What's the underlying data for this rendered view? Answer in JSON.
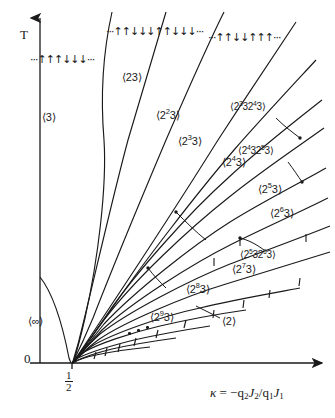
{
  "figure": {
    "type": "phase-diagram"
  },
  "axes": {
    "y_label": "T",
    "x_label_parts": {
      "kappa": "κ",
      "equals": "=",
      "expr": "−q",
      "sub2": "2",
      "j2": "J",
      "j2sub": "2",
      "slash": "/",
      "q1": "q",
      "q1sub": "1",
      "j1": "J",
      "j1sub": "1"
    },
    "x_label_plain": "κ = −q₂J₂/q₁J₁",
    "origin_label": "0",
    "tick_numerator": "1",
    "tick_denominator": "2",
    "tick_label_plain": "1/2",
    "y_axis_x": 40,
    "x_axis_y": 363,
    "tick_half_x": 72
  },
  "spin_sequences": [
    {
      "id": "seq-3",
      "text": "···↑↑↑↓↓↓···",
      "phase": "3"
    },
    {
      "id": "seq-23",
      "text": "···↑↑↓↓↓↑↑↓↓↓···",
      "phase": "23"
    },
    {
      "id": "seq-223",
      "text": "···↑↑↓↓↑↑↑···",
      "phase": "2²23"
    }
  ],
  "phases": [
    {
      "id": "p-3",
      "base": "3",
      "exp": "",
      "tail": "",
      "plain": "⟨3⟩",
      "x": 58,
      "y": 118,
      "size": "lg"
    },
    {
      "id": "p-23",
      "base": "23",
      "exp": "",
      "tail": "",
      "plain": "⟨23⟩",
      "x": 134,
      "y": 78,
      "size": "lg"
    },
    {
      "id": "p-2e2-3",
      "base": "2",
      "exp": "2",
      "tail": "3",
      "plain": "⟨2²3⟩",
      "x": 166,
      "y": 116,
      "size": "lg"
    },
    {
      "id": "p-2e3-3",
      "base": "2",
      "exp": "3",
      "tail": "3",
      "plain": "⟨2³3⟩",
      "x": 192,
      "y": 142,
      "size": "lg"
    },
    {
      "id": "p-2e4-3",
      "base": "2",
      "exp": "4",
      "tail": "3",
      "plain": "⟨2⁶3⟩",
      "x": 232,
      "y": 163,
      "size": "lg"
    },
    {
      "id": "p-2e5-3",
      "base": "2",
      "exp": "5",
      "tail": "3",
      "plain": "⟨2⁵3⟩",
      "x": 268,
      "y": 190,
      "size": "lg"
    },
    {
      "id": "p-2e6-3",
      "base": "2",
      "exp": "6",
      "tail": "3",
      "plain": "⟨2⁶3⟩",
      "x": 280,
      "y": 214,
      "size": "lg"
    },
    {
      "id": "p-2e7-3",
      "base": "2",
      "exp": "7",
      "tail": "3",
      "plain": "⟨2⁷3⟩",
      "x": 244,
      "y": 270,
      "size": "lg"
    },
    {
      "id": "p-2e8-3",
      "base": "2",
      "exp": "8",
      "tail": "3",
      "plain": "⟨2⁸3⟩",
      "x": 196,
      "y": 290,
      "size": "lg"
    },
    {
      "id": "p-2e9-3",
      "base": "2",
      "exp": "9",
      "tail": "3",
      "plain": "⟨2⁹3⟩",
      "x": 160,
      "y": 318,
      "size": "lg"
    },
    {
      "id": "p-2",
      "base": "2",
      "exp": "",
      "tail": "",
      "plain": "⟨2⟩",
      "x": 232,
      "y": 322,
      "size": "lg"
    },
    {
      "id": "p-inf",
      "base": "∞",
      "exp": "",
      "tail": "",
      "plain": "⟨∞⟩",
      "x": 40,
      "y": 322,
      "size": "lg"
    }
  ],
  "mixed_phases": [
    {
      "id": "m-2332343",
      "plain": "⟨2³ 3 2⁴ 3⟩",
      "a_exp": "3",
      "b_exp": "4",
      "x": 258,
      "y": 108
    },
    {
      "id": "m-2432533",
      "plain": "⟨2⁴ 3 2⁵ 3⟩",
      "a_exp": "4",
      "b_exp": "5",
      "x": 266,
      "y": 152
    },
    {
      "id": "m-2532633",
      "plain": "⟨2⁵ 3 2⁶ 3⟩",
      "a_exp": "5",
      "b_exp": "6",
      "x": 268,
      "y": 256
    }
  ],
  "ellipsis_dots": {
    "count": 3,
    "x": 132,
    "y": 332
  },
  "colors": {
    "ink": "#1a1a1a",
    "background": "#ffffff"
  }
}
